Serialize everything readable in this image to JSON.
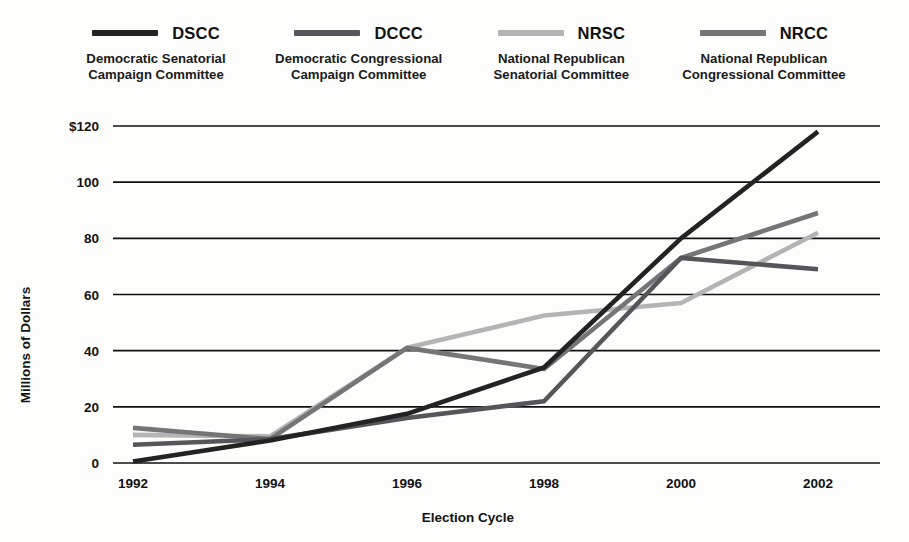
{
  "legend": {
    "items": [
      {
        "abbr": "DSCC",
        "full": "Democratic Senatorial\nCampaign Committee",
        "color": "#232323",
        "swatch_name": "legend-swatch-dscc"
      },
      {
        "abbr": "DCCC",
        "full": "Democratic Congressional\nCampaign Committee",
        "color": "#56565a",
        "swatch_name": "legend-swatch-dccc"
      },
      {
        "abbr": "NRSC",
        "full": "National Republican\nSenatorial Committee",
        "color": "#b4b4b4",
        "swatch_name": "legend-swatch-nrsc"
      },
      {
        "abbr": "NRCC",
        "full": "National Republican\nCongressional Committee",
        "color": "#757577",
        "swatch_name": "legend-swatch-nrcc"
      }
    ]
  },
  "chart_data": {
    "type": "line",
    "title": "",
    "xlabel": "Election Cycle",
    "ylabel": "Millions of Dollars",
    "categories": [
      "1992",
      "1994",
      "1996",
      "1998",
      "2000",
      "2002"
    ],
    "x_tick_labels": [
      "1992",
      "1994",
      "1996",
      "1998",
      "2000",
      "2002"
    ],
    "y_tick_labels": [
      "$120",
      "100",
      "80",
      "60",
      "40",
      "20",
      "0"
    ],
    "y_ticks": [
      120,
      100,
      80,
      60,
      40,
      20,
      0
    ],
    "ylim": [
      0,
      120
    ],
    "grid": "horizontal",
    "legend_position": "top",
    "series": [
      {
        "name": "DSCC",
        "full_name": "Democratic Senatorial Campaign Committee",
        "color": "#232323",
        "width": 4.6,
        "values": [
          0.5,
          8.0,
          17.5,
          34.0,
          80.0,
          118.0
        ]
      },
      {
        "name": "DCCC",
        "full_name": "Democratic Congressional Campaign Committee",
        "color": "#56565a",
        "width": 4.6,
        "values": [
          6.5,
          8.5,
          16.0,
          22.0,
          73.0,
          69.0
        ]
      },
      {
        "name": "NRSC",
        "full_name": "National Republican Senatorial Committee",
        "color": "#b4b4b4",
        "width": 4.6,
        "values": [
          10.0,
          9.5,
          41.0,
          52.5,
          57.0,
          82.0
        ]
      },
      {
        "name": "NRCC",
        "full_name": "National Republican Congressional Committee",
        "color": "#757577",
        "width": 4.6,
        "values": [
          12.5,
          8.5,
          41.0,
          33.5,
          73.0,
          89.0
        ]
      }
    ]
  }
}
